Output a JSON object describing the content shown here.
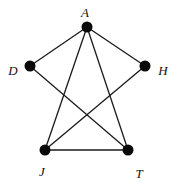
{
  "graph": {
    "nodes": [
      {
        "id": "A",
        "label": "A",
        "x": 87,
        "y": 27,
        "lx": 85,
        "ly": 17
      },
      {
        "id": "D",
        "label": "D",
        "x": 30,
        "y": 66,
        "lx": 13,
        "ly": 75
      },
      {
        "id": "H",
        "label": "H",
        "x": 145,
        "y": 66,
        "lx": 163,
        "ly": 75
      },
      {
        "id": "J",
        "label": "J",
        "x": 45,
        "y": 150,
        "lx": 42,
        "ly": 176
      },
      {
        "id": "T",
        "label": "T",
        "x": 128,
        "y": 150,
        "lx": 139,
        "ly": 178
      }
    ],
    "edges": [
      [
        "A",
        "D"
      ],
      [
        "A",
        "H"
      ],
      [
        "A",
        "J"
      ],
      [
        "A",
        "T"
      ],
      [
        "D",
        "T"
      ],
      [
        "H",
        "J"
      ],
      [
        "J",
        "T"
      ]
    ],
    "style": {
      "node_color": "#0a0a0a",
      "edge_color": "#1a1a1a",
      "node_radius": 5.5
    }
  }
}
